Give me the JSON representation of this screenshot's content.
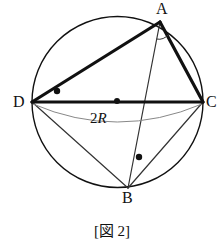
{
  "figure": {
    "caption": "[図 2]",
    "diameter_label": "2R",
    "diameter_label_coefficient": "2",
    "diameter_label_radius_symbol": "R",
    "colors": {
      "stroke_heavy": "#111111",
      "stroke_light": "#333333",
      "stroke_hairline": "#777777",
      "background": "#ffffff",
      "dot": "#111111"
    },
    "circle": {
      "center_x": 117.5,
      "center_y": 102,
      "radius": 85.5,
      "stroke_width": 1.4
    },
    "vertices": [
      {
        "name": "A",
        "label": "A",
        "x": 160,
        "y": 22
      },
      {
        "name": "B",
        "label": "B",
        "x": 128,
        "y": 188
      },
      {
        "name": "C",
        "label": "C",
        "x": 203,
        "y": 102
      },
      {
        "name": "D",
        "label": "D",
        "x": 32,
        "y": 102
      }
    ],
    "segments": [
      {
        "name": "DA",
        "from": "D",
        "to": "A",
        "weight": "heavy",
        "width": 3.2
      },
      {
        "name": "AC",
        "from": "A",
        "to": "C",
        "weight": "heavy",
        "width": 3.2
      },
      {
        "name": "DC",
        "from": "D",
        "to": "C",
        "weight": "heavy",
        "width": 3.2
      },
      {
        "name": "AB",
        "from": "A",
        "to": "B",
        "weight": "light",
        "width": 1.2
      },
      {
        "name": "DB",
        "from": "D",
        "to": "B",
        "weight": "light",
        "width": 1.2
      },
      {
        "name": "CB",
        "from": "C",
        "to": "B",
        "weight": "light",
        "width": 1.2
      }
    ],
    "dots": [
      {
        "name": "center-dot",
        "x": 117,
        "y": 101,
        "r": 3.0
      },
      {
        "name": "angle-dot-adc",
        "x": 57,
        "y": 91,
        "r": 3.2
      },
      {
        "name": "angle-dot-abc",
        "x": 139,
        "y": 157,
        "r": 3.2
      }
    ],
    "angle_arc_at_a": {
      "name": "angle-arc-at-a",
      "description": "small arc marking angle BAC at vertex A"
    },
    "diameter_arc": {
      "name": "diameter-measure-arc",
      "description": "thin arc bowing below chord DC annotated 2R"
    }
  }
}
